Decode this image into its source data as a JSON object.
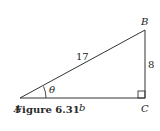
{
  "figure": {
    "caption": "Figure 6.31",
    "vertices": {
      "A": "A",
      "B": "B",
      "C": "C"
    },
    "sides": {
      "hypotenuse": "17",
      "opposite": "8",
      "adjacent": "b"
    },
    "angle": "θ",
    "right_angle_at": "C"
  }
}
